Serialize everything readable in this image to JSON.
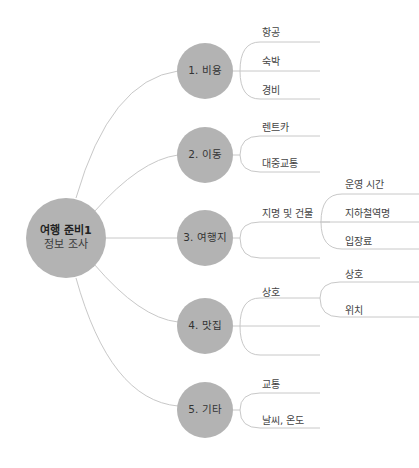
{
  "root": {
    "line1": "여행 준비1",
    "line2": "정보 조사"
  },
  "categories": [
    {
      "label": "1. 비용",
      "children": [
        "항공",
        "숙박",
        "경비"
      ]
    },
    {
      "label": "2. 이동",
      "children": [
        "렌트카",
        "대중교통"
      ]
    },
    {
      "label": "3. 여행지",
      "children": [
        "지명 및 건물"
      ],
      "grandchildren": [
        "운영 시간",
        "지하철역명",
        "입장료"
      ]
    },
    {
      "label": "4. 맛집",
      "children": [
        "상호"
      ],
      "grandchildren": [
        "상호",
        "위치"
      ]
    },
    {
      "label": "5. 기타",
      "children": [
        "교통",
        "날씨, 온도"
      ]
    }
  ],
  "colors": {
    "node": "#b3b3b3",
    "line": "#c8c8c8",
    "text": "#444444"
  }
}
